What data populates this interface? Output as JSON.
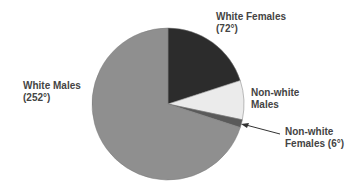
{
  "chart_data": {
    "type": "pie",
    "title": "",
    "unit": "degrees",
    "slices": [
      {
        "name": "White Females",
        "value": 72,
        "color": "#2c2c2c",
        "label_lines": [
          "White Females",
          "(72°)"
        ]
      },
      {
        "name": "Non-white Males",
        "value": 30,
        "color": "#ebebeb",
        "label_lines": [
          "Non-white",
          "Males"
        ]
      },
      {
        "name": "Non-white Females",
        "value": 6,
        "color": "#5a5a5a",
        "label_lines": [
          "Non-white",
          "Females (6°)"
        ]
      },
      {
        "name": "White Males",
        "value": 252,
        "color": "#8f8f8f",
        "label_lines": [
          "White Males",
          "(252°)"
        ]
      }
    ],
    "start_angle": "top",
    "direction": "clockwise",
    "annotations": [
      {
        "type": "arrow",
        "target": "Non-white Females",
        "from_label": "Non-white Females (6°)"
      }
    ]
  }
}
